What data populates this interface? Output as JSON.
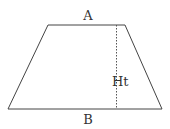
{
  "diagram": {
    "shape": "trapezoid",
    "labels": {
      "top": "A",
      "height": "Ht",
      "bottom": "B"
    },
    "colors": {
      "stroke": "#444444",
      "text": "#333333",
      "background": "#ffffff"
    }
  }
}
